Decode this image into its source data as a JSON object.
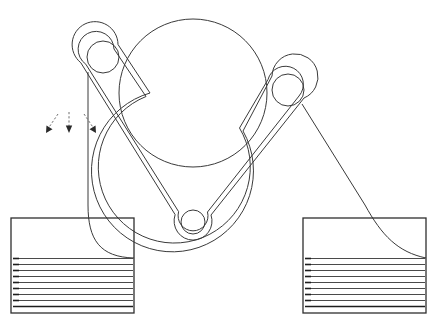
{
  "figure": {
    "background_color": "#ffffff",
    "line_color": "#3a3a3a",
    "width": 442,
    "height": 321
  },
  "pulleys": [
    {
      "id": "main-drum",
      "label": "main-drum",
      "cx": 193,
      "cy": 93,
      "r": 74
    },
    {
      "id": "upper-left-pulley",
      "label": "upper-left-pulley",
      "cx": 103,
      "cy": 57,
      "r": 16
    },
    {
      "id": "upper-right-pulley",
      "label": "upper-right-pulley",
      "cx": 288,
      "cy": 90,
      "r": 16
    },
    {
      "id": "bottom-pulley",
      "label": "bottom-pulley",
      "cx": 193,
      "cy": 222,
      "r": 12
    }
  ],
  "belt": {
    "label": "belt-loop",
    "outer_offset": 7,
    "inner_offset": 2,
    "color": "#3a3a3a"
  },
  "stacks": [
    {
      "id": "left-stack",
      "label": "left-sheet-stack",
      "box_x": 11,
      "box_y": 218,
      "box_width": 123,
      "box_height": 95,
      "sheet_top": 258,
      "sheet_count": 9,
      "sheet_spacing": 6
    },
    {
      "id": "right-stack",
      "label": "right-sheet-stack",
      "box_x": 303,
      "box_y": 218,
      "box_width": 123,
      "box_height": 95,
      "sheet_top": 258,
      "sheet_count": 9,
      "sheet_spacing": 6
    }
  ],
  "web_curves": [
    {
      "id": "left-web-curve",
      "label": "left-web-feed-curve",
      "path": "M 88 72 L 88 205 C 88 240 100 257 134 258"
    },
    {
      "id": "right-web-curve",
      "label": "right-web-feed-curve",
      "path": "M 302 104 L 365 205 C 382 236 398 252 426 258"
    }
  ],
  "arrows": [
    {
      "id": "arrow-left",
      "label": "flow-arrow-left",
      "x1": 58,
      "y1": 114,
      "x2": 46,
      "y2": 132,
      "dashed": true
    },
    {
      "id": "arrow-center",
      "label": "flow-arrow-center",
      "x1": 69,
      "y1": 112,
      "x2": 69,
      "y2": 132,
      "dashed": true
    },
    {
      "id": "arrow-right",
      "label": "flow-arrow-right",
      "x1": 84,
      "y1": 114,
      "x2": 96,
      "y2": 132,
      "dashed": true
    }
  ]
}
